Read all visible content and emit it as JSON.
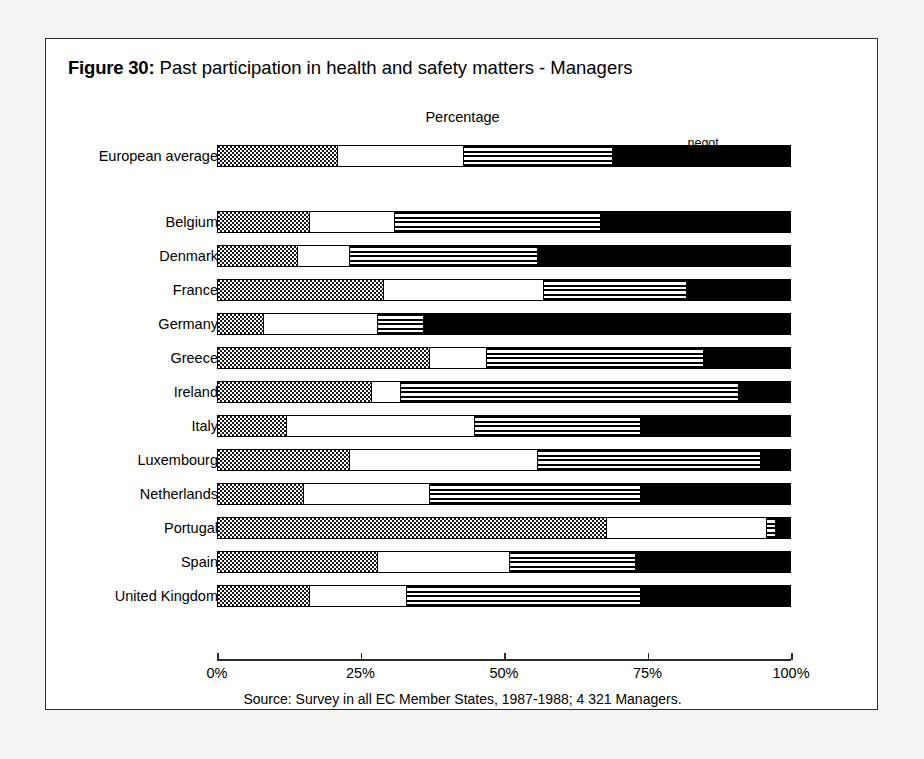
{
  "figure": {
    "label": "Figure 30:",
    "title": "Past participation in health and safety matters - Managers",
    "percentage_caption": "Percentage",
    "source": "Source: Survey in all EC Member States, 1987-1988; 4 321 Managers."
  },
  "axis": {
    "ticks": [
      {
        "value": 0,
        "label": "0%"
      },
      {
        "value": 25,
        "label": "25%"
      },
      {
        "value": 50,
        "label": "50%"
      },
      {
        "value": 75,
        "label": "75%"
      },
      {
        "value": 100,
        "label": "100%"
      }
    ],
    "min": 0,
    "max": 100
  },
  "legend": [
    {
      "key": "no_involvement",
      "label": "no involvement",
      "center": 11,
      "pattern": "checkered-dots"
    },
    {
      "key": "information",
      "label": "information",
      "center": 32,
      "pattern": "white"
    },
    {
      "key": "consultation",
      "label": "consultation",
      "center": 56,
      "pattern": "horizontal-stripes"
    },
    {
      "key": "negot_joint_decision",
      "label": "negot.\njoint decision",
      "center": 85,
      "pattern": "solid-black",
      "line1": "negot.",
      "line2": "joint decision"
    }
  ],
  "chart_data": {
    "type": "bar",
    "orientation": "horizontal",
    "stacked": true,
    "normalized_percent": true,
    "title": "Past participation in health and safety matters - Managers",
    "xlabel": "Percentage",
    "ylabel": "",
    "xlim": [
      0,
      100
    ],
    "grid": false,
    "legend_position": "top",
    "series": [
      {
        "name": "no involvement",
        "values": [
          21,
          16,
          14,
          29,
          8,
          37,
          27,
          12,
          23,
          15,
          68,
          28,
          16
        ]
      },
      {
        "name": "information",
        "values": [
          22,
          15,
          9,
          28,
          20,
          10,
          5,
          33,
          33,
          22,
          28,
          23,
          17
        ]
      },
      {
        "name": "consultation",
        "values": [
          26,
          36,
          33,
          25,
          8,
          38,
          59,
          29,
          39,
          37,
          1.5,
          22,
          41
        ]
      },
      {
        "name": "negot. joint decision",
        "values": [
          31,
          33,
          44,
          18,
          64,
          15,
          9,
          26,
          5,
          26,
          2.5,
          27,
          26
        ]
      }
    ],
    "categories": [
      "European average",
      "Belgium",
      "Denmark",
      "France",
      "Germany",
      "Greece",
      "Ireland",
      "Italy",
      "Luxembourg",
      "Netherlands",
      "Portugal",
      "Spain",
      "United Kingdom"
    ]
  },
  "rows": [
    {
      "label": "European average",
      "top": 106,
      "gap_after": true,
      "segments": [
        21,
        22,
        26,
        31
      ]
    },
    {
      "label": "Belgium",
      "top": 172,
      "segments": [
        16,
        15,
        36,
        33
      ]
    },
    {
      "label": "Denmark",
      "top": 206,
      "segments": [
        14,
        9,
        33,
        44
      ]
    },
    {
      "label": "France",
      "top": 240,
      "segments": [
        29,
        28,
        25,
        18
      ]
    },
    {
      "label": "Germany",
      "top": 274,
      "segments": [
        8,
        20,
        8,
        64
      ]
    },
    {
      "label": "Greece",
      "top": 308,
      "segments": [
        37,
        10,
        38,
        15
      ]
    },
    {
      "label": "Ireland",
      "top": 342,
      "segments": [
        27,
        5,
        59,
        9
      ]
    },
    {
      "label": "Italy",
      "top": 376,
      "segments": [
        12,
        33,
        29,
        26
      ]
    },
    {
      "label": "Luxembourg",
      "top": 410,
      "segments": [
        23,
        33,
        39,
        5
      ]
    },
    {
      "label": "Netherlands",
      "top": 444,
      "segments": [
        15,
        22,
        37,
        26
      ]
    },
    {
      "label": "Portugal",
      "top": 478,
      "segments": [
        68,
        28,
        1.5,
        2.5
      ]
    },
    {
      "label": "Spain",
      "top": 512,
      "segments": [
        28,
        23,
        22,
        27
      ]
    },
    {
      "label": "United Kingdom",
      "top": 546,
      "segments": [
        16,
        17,
        41,
        26
      ]
    }
  ]
}
